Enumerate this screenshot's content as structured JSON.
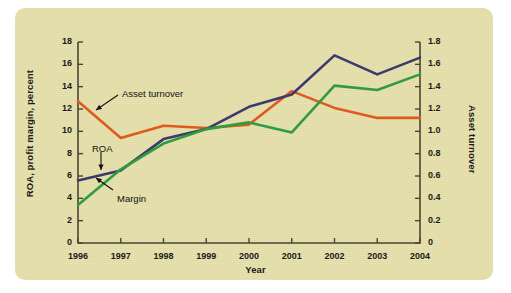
{
  "figure": {
    "background_color": "#e6dfab",
    "page_color": "#ffffff"
  },
  "chart_data": {
    "type": "line",
    "title": "",
    "xlabel": "Year",
    "ylabel": "ROA, profit margin, percent",
    "y2label": "Asset turnover",
    "x": [
      1996,
      1997,
      1998,
      1999,
      2000,
      2001,
      2002,
      2003,
      2004
    ],
    "categories": [
      "1996",
      "1997",
      "1998",
      "1999",
      "2000",
      "2001",
      "2002",
      "2003",
      "2004"
    ],
    "xticklabels": [
      "1996",
      "1997",
      "1998",
      "1999",
      "2000",
      "2001",
      "2002",
      "2003",
      "2004"
    ],
    "yticklabels": [
      "0",
      "2",
      "4",
      "6",
      "8",
      "10",
      "12",
      "14",
      "16",
      "18"
    ],
    "y2ticklabels": [
      "0",
      "0.2",
      "0.4",
      "0.6",
      "0.8",
      "1.0",
      "1.2",
      "1.4",
      "1.6",
      "1.8"
    ],
    "ylim": [
      0,
      18
    ],
    "y2lim": [
      0,
      1.8
    ],
    "grid": false,
    "legend": "inline-annotations",
    "series": [
      {
        "name": "Asset turnover",
        "axis": "right",
        "color": "#de5b1e",
        "values": [
          1.27,
          0.94,
          1.05,
          1.03,
          1.06,
          1.36,
          1.21,
          1.12,
          1.12
        ],
        "values_left_scale": [
          12.7,
          9.4,
          10.5,
          10.3,
          10.6,
          13.6,
          12.1,
          11.2,
          11.2
        ]
      },
      {
        "name": "ROA",
        "axis": "left",
        "color": "#3b3a6b",
        "values": [
          5.6,
          6.5,
          9.3,
          10.2,
          12.2,
          13.3,
          16.8,
          15.1,
          16.6
        ]
      },
      {
        "name": "Margin",
        "axis": "left",
        "color": "#2f9c3f",
        "values": [
          3.4,
          6.6,
          8.9,
          10.2,
          10.8,
          9.9,
          14.1,
          13.7,
          15.1
        ]
      }
    ],
    "annotations": [
      {
        "text": "Asset turnover",
        "target_series": "Asset turnover"
      },
      {
        "text": "ROA",
        "target_series": "ROA"
      },
      {
        "text": "Margin",
        "target_series": "Margin"
      }
    ]
  }
}
